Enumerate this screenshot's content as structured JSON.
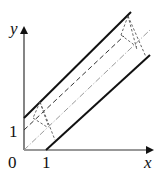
{
  "diagram": {
    "axes": {
      "x_label": "x",
      "y_label": "y",
      "origin_label": "0",
      "x_tick_label": "1",
      "y_tick_label": "1"
    },
    "lines": [
      {
        "name": "upper-boundary",
        "style": "solid"
      },
      {
        "name": "lower-boundary",
        "style": "solid"
      },
      {
        "name": "axis-line",
        "style": "dashed"
      },
      {
        "name": "diagonal-line",
        "style": "dash-dot"
      }
    ],
    "colors": {
      "stroke": "#111111",
      "axis": "#333333",
      "light": "#9a9a9a"
    }
  }
}
